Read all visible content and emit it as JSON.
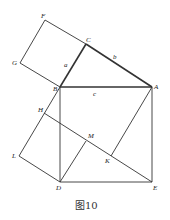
{
  "figure": {
    "caption": "图10",
    "points": {
      "F": "F",
      "C": "C",
      "G": "G",
      "B": "B",
      "A": "A",
      "H": "H",
      "M": "M",
      "L": "L",
      "K": "K",
      "D": "D",
      "E": "E"
    },
    "sides": {
      "a": "a",
      "b": "b",
      "c": "c"
    }
  }
}
